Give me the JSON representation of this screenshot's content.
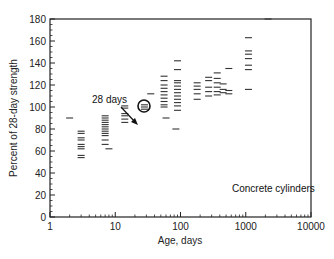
{
  "chart_data": {
    "type": "scatter",
    "title": "",
    "xlabel": "Age, days",
    "ylabel": "Percent of 28-day strength",
    "xscale": "log",
    "xlim": [
      1,
      10000
    ],
    "ylim": [
      0,
      180
    ],
    "xticks": [
      "1",
      "10",
      "100",
      "1000",
      "10000"
    ],
    "yticks": [
      "0",
      "20",
      "40",
      "60",
      "80",
      "100",
      "120",
      "140",
      "160",
      "180"
    ],
    "grid": false,
    "marker": "short horizontal dash",
    "annotations": [
      {
        "text": "28 days",
        "points_to": {
          "x": 28,
          "y": 100
        },
        "marker": "circle"
      },
      {
        "text": "Concrete cylinders",
        "position": "lower right inside plot"
      }
    ],
    "series": [
      {
        "name": "Concrete cylinders",
        "points": [
          {
            "x": 2,
            "y": 90
          },
          {
            "x": 3,
            "y": 78
          },
          {
            "x": 3,
            "y": 76
          },
          {
            "x": 3,
            "y": 72
          },
          {
            "x": 3,
            "y": 70
          },
          {
            "x": 3,
            "y": 66
          },
          {
            "x": 3,
            "y": 64
          },
          {
            "x": 3,
            "y": 62
          },
          {
            "x": 3,
            "y": 56
          },
          {
            "x": 3,
            "y": 54
          },
          {
            "x": 7,
            "y": 92
          },
          {
            "x": 7,
            "y": 90
          },
          {
            "x": 7,
            "y": 88
          },
          {
            "x": 7,
            "y": 86
          },
          {
            "x": 7,
            "y": 84
          },
          {
            "x": 7,
            "y": 82
          },
          {
            "x": 7,
            "y": 80
          },
          {
            "x": 7,
            "y": 78
          },
          {
            "x": 7,
            "y": 76
          },
          {
            "x": 7,
            "y": 74
          },
          {
            "x": 7,
            "y": 70
          },
          {
            "x": 7,
            "y": 66
          },
          {
            "x": 8,
            "y": 62
          },
          {
            "x": 14,
            "y": 101
          },
          {
            "x": 14,
            "y": 99
          },
          {
            "x": 14,
            "y": 94
          },
          {
            "x": 14,
            "y": 92
          },
          {
            "x": 14,
            "y": 89
          },
          {
            "x": 14,
            "y": 86
          },
          {
            "x": 28,
            "y": 100
          },
          {
            "x": 28,
            "y": 102
          },
          {
            "x": 28,
            "y": 98
          },
          {
            "x": 35,
            "y": 112
          },
          {
            "x": 56,
            "y": 128
          },
          {
            "x": 56,
            "y": 124
          },
          {
            "x": 56,
            "y": 120
          },
          {
            "x": 56,
            "y": 117
          },
          {
            "x": 56,
            "y": 114
          },
          {
            "x": 56,
            "y": 111
          },
          {
            "x": 56,
            "y": 108
          },
          {
            "x": 56,
            "y": 105
          },
          {
            "x": 56,
            "y": 102
          },
          {
            "x": 56,
            "y": 100
          },
          {
            "x": 60,
            "y": 90
          },
          {
            "x": 90,
            "y": 142
          },
          {
            "x": 90,
            "y": 134
          },
          {
            "x": 90,
            "y": 124
          },
          {
            "x": 90,
            "y": 122
          },
          {
            "x": 90,
            "y": 119
          },
          {
            "x": 90,
            "y": 116
          },
          {
            "x": 90,
            "y": 113
          },
          {
            "x": 90,
            "y": 110
          },
          {
            "x": 90,
            "y": 107
          },
          {
            "x": 90,
            "y": 104
          },
          {
            "x": 90,
            "y": 101
          },
          {
            "x": 90,
            "y": 97
          },
          {
            "x": 85,
            "y": 80
          },
          {
            "x": 180,
            "y": 122
          },
          {
            "x": 180,
            "y": 119
          },
          {
            "x": 180,
            "y": 116
          },
          {
            "x": 180,
            "y": 112
          },
          {
            "x": 180,
            "y": 107
          },
          {
            "x": 270,
            "y": 127
          },
          {
            "x": 270,
            "y": 124
          },
          {
            "x": 270,
            "y": 118
          },
          {
            "x": 270,
            "y": 114
          },
          {
            "x": 270,
            "y": 110
          },
          {
            "x": 365,
            "y": 131
          },
          {
            "x": 365,
            "y": 126
          },
          {
            "x": 365,
            "y": 122
          },
          {
            "x": 365,
            "y": 118
          },
          {
            "x": 365,
            "y": 114
          },
          {
            "x": 365,
            "y": 111
          },
          {
            "x": 450,
            "y": 121
          },
          {
            "x": 450,
            "y": 116
          },
          {
            "x": 450,
            "y": 113
          },
          {
            "x": 550,
            "y": 135
          },
          {
            "x": 550,
            "y": 115
          },
          {
            "x": 550,
            "y": 112
          },
          {
            "x": 1100,
            "y": 163
          },
          {
            "x": 1100,
            "y": 151
          },
          {
            "x": 1100,
            "y": 148
          },
          {
            "x": 1100,
            "y": 144
          },
          {
            "x": 1100,
            "y": 138
          },
          {
            "x": 1100,
            "y": 134
          },
          {
            "x": 1100,
            "y": 116
          },
          {
            "x": 2200,
            "y": 180
          }
        ]
      }
    ]
  },
  "labels": {
    "xlabel": "Age, days",
    "ylabel": "Percent of 28-day strength",
    "annotation_28": "28 days",
    "annotation_series": "Concrete cylinders"
  },
  "colors": {
    "axis": "#222222",
    "marker": "#333333",
    "background": "#ffffff"
  }
}
